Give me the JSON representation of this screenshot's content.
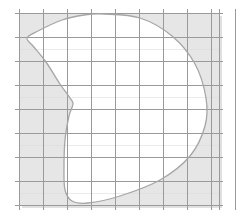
{
  "figure": {
    "caption": "",
    "width": 244,
    "height": 223,
    "background_color": "#ffffff"
  },
  "grid": {
    "label": "coordinate grid",
    "x_start": 19,
    "y_start": 13,
    "cell_width": 24,
    "cell_height": 24,
    "columns": 9,
    "rows": 8,
    "x_end": 219,
    "y_end": 205,
    "line_color": "#9a9a9a",
    "line_width": 1,
    "overhang": 4,
    "panel_fill": "#ededed",
    "minor_line_color": "#d8d8d8"
  },
  "region": {
    "label": "bean-shaped region",
    "fill_color": "#ffffff",
    "stroke_color": "#a6a6a6",
    "stroke_width": 1.3,
    "description": "Closed convex-concave curve occupying most of the grid, concave notch on the left side",
    "key_points": {
      "top_peak": [
        104,
        14
      ],
      "right_extreme": [
        206,
        110
      ],
      "left_upper": [
        28,
        40
      ],
      "left_notch": [
        72,
        101
      ],
      "bottom_left": [
        70,
        203
      ],
      "bottom_right_meet": [
        206,
        112
      ]
    }
  },
  "shading": {
    "label": "outside-region shading",
    "color": "#e6e6e6",
    "description": "Light gray fill between the grid boundary and the bean-shaped region"
  },
  "shadow": {
    "label": "drop shadow",
    "color": "#e0e0e0",
    "offset_x": 3,
    "offset_y": 3
  },
  "chart_data": {
    "type": "area",
    "xlabel": "",
    "ylabel": "",
    "grid": true,
    "legend": "none",
    "xlim": [
      0,
      9
    ],
    "ylim": [
      0,
      8
    ],
    "x_ticks": [
      0,
      1,
      2,
      3,
      4,
      5,
      6,
      7,
      8,
      9
    ],
    "y_ticks": [
      0,
      1,
      2,
      3,
      4,
      5,
      6,
      7,
      8
    ],
    "tick_labels_visible": false,
    "series": [
      {
        "name": "bean-region-boundary",
        "closed": true,
        "fill": "#ffffff",
        "stroke": "#a6a6a6",
        "points_px": [
          [
            104,
            14
          ],
          [
            140,
            18
          ],
          [
            172,
            36
          ],
          [
            195,
            64
          ],
          [
            206,
            98
          ],
          [
            205,
            126
          ],
          [
            190,
            156
          ],
          [
            160,
            180
          ],
          [
            120,
            196
          ],
          [
            88,
            203
          ],
          [
            72,
            201
          ],
          [
            65,
            190
          ],
          [
            64,
            168
          ],
          [
            65,
            140
          ],
          [
            69,
            116
          ],
          [
            73,
            104
          ],
          [
            70,
            98
          ],
          [
            60,
            84
          ],
          [
            46,
            62
          ],
          [
            33,
            46
          ],
          [
            27,
            38
          ],
          [
            38,
            31
          ],
          [
            62,
            20
          ],
          [
            84,
            15
          ]
        ]
      }
    ]
  }
}
